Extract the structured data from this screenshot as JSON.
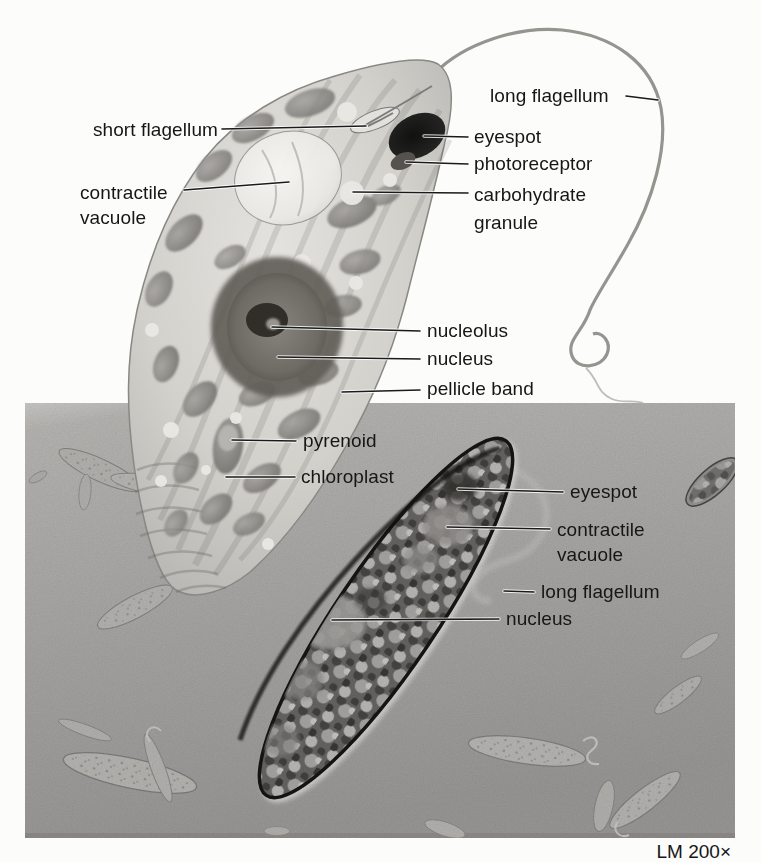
{
  "figure": {
    "type": "labeled biology diagram of Euglena with corresponding light micrograph",
    "caption": "LM 200×",
    "colors": {
      "page_background": "#fcfcfb",
      "label_text": "#161616",
      "leader_line": "#1a1a1a",
      "micrograph_background": "#b0aeac",
      "illustration_body": "#cfcec9",
      "chloroplast": "#7b7975",
      "nucleus": "#6e6b66",
      "eyespot": "#1c1c1c"
    },
    "labels_illustration": [
      {
        "id": "short-flagellum",
        "text": "short flagellum"
      },
      {
        "id": "contractile-vacuole",
        "text": "contractile\nvacuole"
      },
      {
        "id": "long-flagellum",
        "text": "long flagellum"
      },
      {
        "id": "eyespot",
        "text": "eyespot"
      },
      {
        "id": "photoreceptor",
        "text": "photoreceptor"
      },
      {
        "id": "carbohydrate-granule",
        "text": "carbohydrate\ngranule"
      },
      {
        "id": "nucleolus",
        "text": "nucleolus"
      },
      {
        "id": "nucleus",
        "text": "nucleus"
      },
      {
        "id": "pellicle-band",
        "text": "pellicle band"
      },
      {
        "id": "pyrenoid",
        "text": "pyrenoid"
      },
      {
        "id": "chloroplast",
        "text": "chloroplast"
      }
    ],
    "labels_micrograph": [
      {
        "id": "eyespot-m",
        "text": "eyespot"
      },
      {
        "id": "contractile-vacuole-m",
        "text": "contractile\nvacuole"
      },
      {
        "id": "long-flagellum-m",
        "text": "long flagellum"
      },
      {
        "id": "nucleus-m",
        "text": "nucleus"
      }
    ]
  }
}
